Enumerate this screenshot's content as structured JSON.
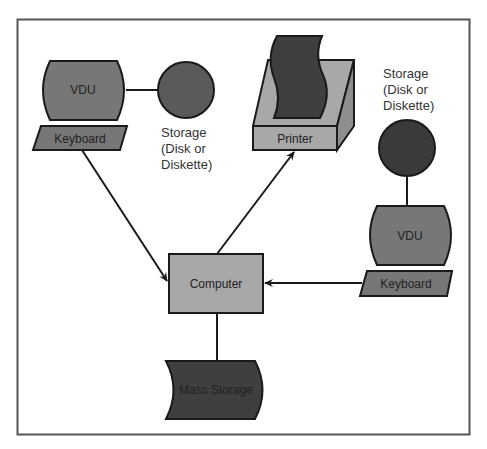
{
  "diagram": {
    "colors": {
      "frame": "#555555",
      "dark": "#3f3f3f",
      "medium": "#777777",
      "light": "#a8a8a8",
      "line": "#1a1a1a"
    },
    "nodes": {
      "vdu_left": {
        "label": "VDU"
      },
      "keyboard_left": {
        "label": "Keyboard"
      },
      "storage_left": {
        "caption": [
          "Storage",
          "(Disk or",
          "Diskette)"
        ]
      },
      "printer": {
        "label": "Printer"
      },
      "storage_right": {
        "caption": [
          "Storage",
          "(Disk or",
          "Diskette)"
        ]
      },
      "vdu_right": {
        "label": "VDU"
      },
      "keyboard_right": {
        "label": "Keyboard"
      },
      "computer": {
        "label": "Computer"
      },
      "mass_storage": {
        "label": "Mass Storage"
      }
    },
    "edges": [
      {
        "from": "vdu_left",
        "to": "storage_left",
        "type": "line"
      },
      {
        "from": "keyboard_left",
        "to": "computer",
        "type": "arrow"
      },
      {
        "from": "computer",
        "to": "printer",
        "type": "arrow"
      },
      {
        "from": "storage_right",
        "to": "vdu_right",
        "type": "line"
      },
      {
        "from": "keyboard_right",
        "to": "computer",
        "type": "arrow"
      },
      {
        "from": "computer",
        "to": "mass_storage",
        "type": "line"
      }
    ]
  }
}
